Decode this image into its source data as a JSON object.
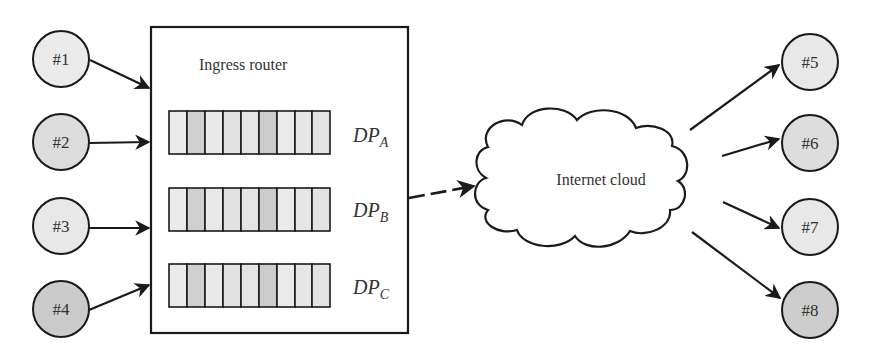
{
  "diagram": {
    "router": {
      "title": "Ingress router"
    },
    "queues": [
      {
        "label_main": "DP",
        "label_sub": "A",
        "cells": [
          "#eaeaea",
          "#cfcfcf",
          "#e8e8e8",
          "#e2e2e2",
          "#e4e4e4",
          "#cccccc",
          "#ebebeb",
          "#e6e6e6",
          "#e3e3e3"
        ]
      },
      {
        "label_main": "DP",
        "label_sub": "B",
        "cells": [
          "#eaeaea",
          "#cfcfcf",
          "#e8e8e8",
          "#e2e2e2",
          "#e4e4e4",
          "#cccccc",
          "#ebebeb",
          "#e6e6e6",
          "#e3e3e3"
        ]
      },
      {
        "label_main": "DP",
        "label_sub": "C",
        "cells": [
          "#eaeaea",
          "#cfcfcf",
          "#e8e8e8",
          "#e2e2e2",
          "#e4e4e4",
          "#cccccc",
          "#ebebeb",
          "#e6e6e6",
          "#e3e3e3"
        ]
      }
    ],
    "cloud": {
      "label": "Internet cloud"
    },
    "sources": [
      {
        "label": "#1",
        "fill": "#ebebeb"
      },
      {
        "label": "#2",
        "fill": "#dcdcdc"
      },
      {
        "label": "#3",
        "fill": "#e8e8e8"
      },
      {
        "label": "#4",
        "fill": "#cbcbcb"
      }
    ],
    "destinations": [
      {
        "label": "#5",
        "fill": "#e8e8e8"
      },
      {
        "label": "#6",
        "fill": "#dddddd"
      },
      {
        "label": "#7",
        "fill": "#e8e8e8"
      },
      {
        "label": "#8",
        "fill": "#cdcdcd"
      }
    ],
    "colors": {
      "stroke": "#1a1a1a",
      "text": "#333333",
      "background": "#ffffff"
    }
  }
}
